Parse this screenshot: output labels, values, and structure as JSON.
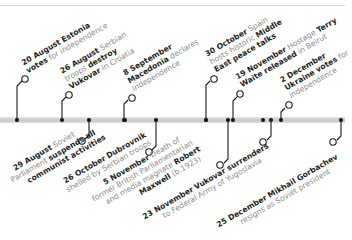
{
  "timeline": {
    "bar_color": "#d0d0d0",
    "marker_color": "#1a1a1a",
    "date_text_color": "#1e1e1e",
    "body_text_color": "#8a8a8a",
    "events_above": [
      {
        "id": "e1",
        "date": "20 August",
        "lines": [
          [
            "20 August",
            " Estonia"
          ],
          [
            "votes",
            " for independence"
          ]
        ],
        "x": 14
      },
      {
        "id": "e2",
        "date": "26 August",
        "lines": [
          [
            "26 August",
            " Serbian"
          ],
          [
            "",
            "troops "
          ],
          [
            "destroy",
            ""
          ],
          [
            "Vukovar",
            " in Croatia"
          ]
        ],
        "x": 61
      },
      {
        "id": "e3",
        "date": "8 September",
        "lines": [
          [
            "8 September",
            ""
          ],
          [
            "Macedonia",
            " declares"
          ],
          [
            "",
            "independence"
          ]
        ],
        "x": 123
      },
      {
        "id": "e4",
        "date": "30 October",
        "lines": [
          [
            "30 October",
            " Spain"
          ],
          [
            "",
            "hosts historic "
          ],
          [
            "Middle",
            ""
          ],
          [
            "East peace talks",
            ""
          ]
        ],
        "x": 217
      },
      {
        "id": "e5",
        "date": "19 November",
        "lines": [
          [
            "19 November",
            " Hostage "
          ],
          [
            "Terry",
            ""
          ],
          [
            "Waite released",
            " in Beirut"
          ]
        ],
        "x": 234
      },
      {
        "id": "e6",
        "date": "2 December",
        "lines": [
          [
            "2 December",
            ""
          ],
          [
            "Ukraine votes",
            " for"
          ],
          [
            "",
            "independence"
          ]
        ],
        "x": 281
      }
    ],
    "events_below": [
      {
        "id": "e7",
        "date": "29 August",
        "lines": [
          [
            "29 August",
            " Soviet"
          ],
          [
            "",
            "Parliament "
          ],
          [
            "suspends all",
            ""
          ],
          [
            "communist activities",
            ""
          ]
        ],
        "x": 89
      },
      {
        "id": "e8",
        "date": "26 October",
        "lines": [
          [
            "26 October",
            " "
          ],
          [
            "Dubrovnik",
            ""
          ],
          [
            "",
            "shelled by Serbian troops"
          ]
        ],
        "x": 155
      },
      {
        "id": "e9",
        "date": "5 November",
        "lines": [
          [
            "5 November",
            " Death of"
          ],
          [
            "",
            "former British Parliamentarian"
          ],
          [
            "",
            "and media magnate "
          ],
          [
            "Robert",
            ""
          ],
          [
            "Maxwell",
            " (b.1923)"
          ]
        ],
        "x": 228
      },
      {
        "id": "e10",
        "date": "23 November",
        "lines": [
          [
            "23 November Vukovar surrenders",
            ""
          ],
          [
            "",
            "to Federal Army of Yugoslavia"
          ]
        ],
        "x": 271
      },
      {
        "id": "e11",
        "date": "25 December",
        "lines": [
          [
            "25 December Mikhail Gorbachev",
            ""
          ],
          [
            "",
            "resigns as Soviet president"
          ]
        ],
        "x": 340
      }
    ]
  },
  "labels": {
    "e1": {
      "date": "20 August",
      "bold_a": "Estonia",
      "bold_b": "votes",
      "text_b": "for independence"
    },
    "e2": {
      "date": "26 August",
      "text_a": "Serbian",
      "text_b": "troops",
      "bold_b": "destroy",
      "bold_c": "Vukovar",
      "text_c": "in Croatia"
    },
    "e3": {
      "date": "8 September",
      "bold_b": "Macedonia",
      "text_b": "declares",
      "text_c": "independence"
    },
    "e4": {
      "date": "30 October",
      "text_a": "Spain",
      "text_b": "hosts historic",
      "bold_b": "Middle",
      "bold_c": "East peace talks"
    },
    "e5": {
      "date": "19 November",
      "text_a": "Hostage",
      "bold_a": "Terry",
      "bold_b": "Waite released",
      "text_b": "in Beirut"
    },
    "e6": {
      "date": "2 December",
      "bold_b": "Ukraine votes",
      "text_b": "for",
      "text_c": "independence"
    },
    "e7": {
      "date": "29 August",
      "text_a": "Soviet",
      "text_b": "Parliament",
      "bold_b": "suspends all",
      "bold_c": "communist activities"
    },
    "e8": {
      "date": "26 October",
      "bold_a": "Dubrovnik",
      "text_b": "shelled by Serbian troops"
    },
    "e9": {
      "date": "5 November",
      "text_a": "Death of",
      "text_b": "former British Parliamentarian",
      "text_c": "and media magnate",
      "bold_c": "Robert",
      "bold_d": "Maxwell",
      "text_d": "(b.1923)"
    },
    "e10": {
      "date": "23 November",
      "bold_a": "Vukovar surrenders",
      "text_b": "to Federal Army of Yugoslavia"
    },
    "e11": {
      "date": "25 December",
      "bold_a": "Mikhail Gorbachev",
      "text_b": "resigns as Soviet president"
    }
  }
}
